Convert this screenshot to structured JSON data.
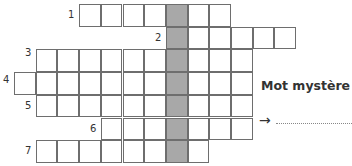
{
  "crossword": {
    "origin_x": 14,
    "origin_y": 4,
    "cell_w": 21.7,
    "cell_h": 22.7,
    "shaded_col": 7,
    "rows": [
      {
        "number": "1",
        "row": 0,
        "start": 3,
        "end": 9,
        "label_x": 68
      },
      {
        "number": "2",
        "row": 1,
        "start": 7,
        "end": 12,
        "label_x": 155
      },
      {
        "number": "3",
        "row": 2,
        "start": 1,
        "end": 10,
        "label_x": 25
      },
      {
        "number": "4",
        "row": 3,
        "start": 0,
        "end": 10,
        "label_x": 3
      },
      {
        "number": "5",
        "row": 4,
        "start": 1,
        "end": 10,
        "label_x": 25
      },
      {
        "number": "6",
        "row": 5,
        "start": 4,
        "end": 10,
        "label_x": 90
      },
      {
        "number": "7",
        "row": 6,
        "start": 1,
        "end": 8,
        "label_x": 25
      }
    ]
  },
  "mystery": {
    "title": "Mot mystère",
    "arrow": "→"
  }
}
